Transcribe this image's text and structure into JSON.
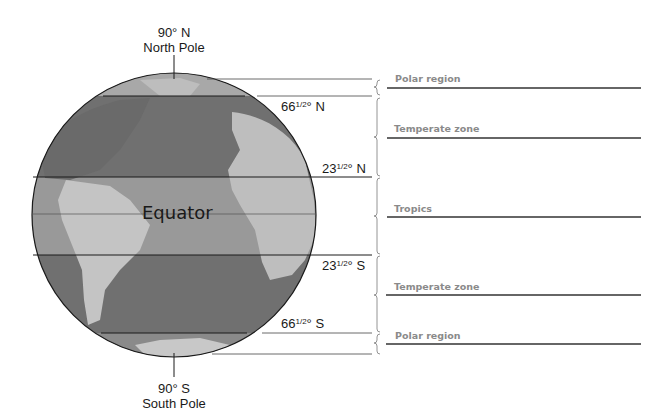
{
  "diagram": {
    "type": "globe-latitude-zones",
    "north_pole": {
      "degree": "90° N",
      "name": "North Pole"
    },
    "south_pole": {
      "degree": "90° S",
      "name": "South Pole"
    },
    "equator_label": "Equator",
    "latitudes": [
      {
        "id": "arctic",
        "whole": "66",
        "frac": "1/2",
        "suffix": "° N"
      },
      {
        "id": "cancer",
        "whole": "23",
        "frac": "1/2",
        "suffix": "° N"
      },
      {
        "id": "capricorn",
        "whole": "23",
        "frac": "1/2",
        "suffix": "° S"
      },
      {
        "id": "antarctic",
        "whole": "66",
        "frac": "1/2",
        "suffix": "° S"
      }
    ],
    "zones": [
      {
        "label": "Polar region"
      },
      {
        "label": "Temperate zone"
      },
      {
        "label": "Tropics"
      },
      {
        "label": "Temperate zone"
      },
      {
        "label": "Polar region"
      }
    ],
    "colors": {
      "ocean": "#6e6e6e",
      "land": "#bdbdbd",
      "tropics_band": "#9a9a9a",
      "zone_label": "#8a8a8a",
      "line": "#1a1a1a"
    }
  }
}
